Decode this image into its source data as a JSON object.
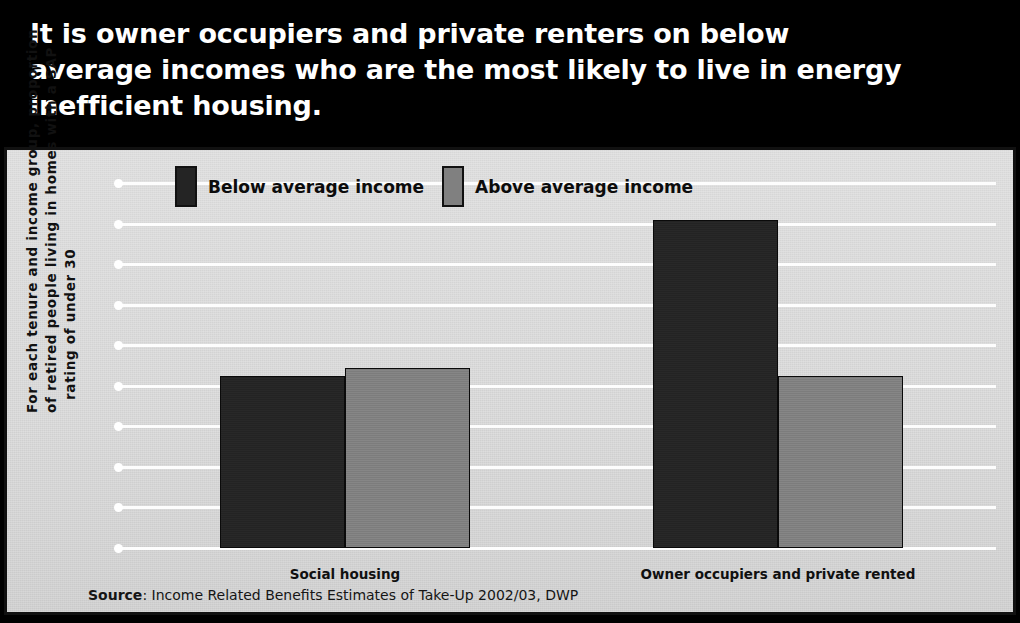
{
  "headline": "It is owner occupiers and private renters on below\naverage incomes who are the most likely to live in energy\ninefficient housing.",
  "yaxis_caption": {
    "line1": "For each tenure and income group, proportion",
    "line2": "of retired people living in homes with a SAP",
    "line3": "rating of under 30"
  },
  "source": {
    "prefix": "Source",
    "text": ": Income Related Benefits Estimates of Take-Up 2002/03, DWP"
  },
  "colors": {
    "banner_background": "#000000",
    "banner_text": "#ffffff",
    "panel_background": "#d9d9d9",
    "panel_border": "#111111",
    "gridline": "#fdfdfd",
    "series_below": "#242424",
    "series_above": "#808080"
  },
  "chart_data": {
    "type": "bar",
    "title": "",
    "subtitle": "",
    "xlabel": "",
    "ylabel": "For each tenure and income group, proportion of retired people living in homes with a SAP rating of under 30",
    "categories": [
      "Social housing",
      "Owner occupiers and private rented"
    ],
    "series": [
      {
        "name": "Below average income",
        "color": "#242424",
        "values": [
          8.5,
          16.2
        ]
      },
      {
        "name": "Above average income",
        "color": "#808080",
        "values": [
          8.9,
          8.5
        ]
      }
    ],
    "ylim": [
      0,
      18
    ],
    "yticks": [
      0,
      2,
      4,
      6,
      8,
      10,
      12,
      14,
      16,
      18
    ],
    "ytick_labels": [
      "0",
      "2",
      "4",
      "6",
      "8",
      "10",
      "12",
      "14",
      "16",
      "18"
    ],
    "grid": true,
    "legend_position": "top-left",
    "legend": [
      "Below average income",
      "Above average income"
    ],
    "annotations": [
      "Source: Income Related Benefits Estimates of Take-Up 2002/03, DWP"
    ]
  }
}
